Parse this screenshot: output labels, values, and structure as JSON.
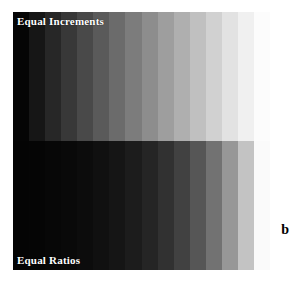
{
  "figure": {
    "letter": "b",
    "panel": {
      "top_label": "Equal Increments",
      "bottom_label": "Equal Ratios",
      "label_color": "#ffffff",
      "background_color": "#ffffff"
    }
  },
  "chart_data": {
    "type": "heatmap",
    "title": "",
    "subtitle": "",
    "xlabel": "",
    "ylabel": "",
    "grid": false,
    "legend_position": "none",
    "colormap": "grayscale",
    "orientation": "horizontal-steps",
    "annotations": [
      {
        "text": "Equal Increments",
        "position": "top-left",
        "color": "#ffffff"
      },
      {
        "text": "Equal Ratios",
        "position": "bottom-left",
        "color": "#ffffff"
      },
      {
        "text": "b",
        "position": "right-margin",
        "color": "#000000"
      }
    ],
    "series": [
      {
        "name": "Equal Increments",
        "description": "Linear (arithmetic) progression of gray levels, left dark to right light",
        "n_steps": 16,
        "x": [
          1,
          2,
          3,
          4,
          5,
          6,
          7,
          8,
          9,
          10,
          11,
          12,
          13,
          14,
          15,
          16
        ],
        "values": [
          5,
          22,
          39,
          56,
          73,
          90,
          107,
          124,
          141,
          158,
          175,
          192,
          209,
          226,
          240,
          252
        ],
        "colors": [
          "#050505",
          "#161616",
          "#272727",
          "#383838",
          "#494949",
          "#5a5a5a",
          "#6b6b6b",
          "#7c7c7c",
          "#8d8d8d",
          "#9e9e9e",
          "#afafaf",
          "#c0c0c0",
          "#d1d1d1",
          "#e2e2e2",
          "#f0f0f0",
          "#fcfcfc"
        ]
      },
      {
        "name": "Equal Ratios",
        "description": "Geometric (constant ratio) progression of gray levels, left dark to right light",
        "n_steps": 16,
        "x": [
          1,
          2,
          3,
          4,
          5,
          6,
          7,
          8,
          9,
          10,
          11,
          12,
          13,
          14,
          15,
          16
        ],
        "values": [
          4,
          5,
          7,
          9,
          12,
          16,
          21,
          28,
          37,
          49,
          65,
          86,
          114,
          151,
          195,
          250
        ],
        "colors": [
          "#040404",
          "#050505",
          "#070707",
          "#090909",
          "#0c0c0c",
          "#101010",
          "#151515",
          "#1c1c1c",
          "#252525",
          "#313131",
          "#414141",
          "#565656",
          "#727272",
          "#979797",
          "#c3c3c3",
          "#fafafa"
        ]
      }
    ],
    "ylim": [
      0,
      255
    ],
    "value_label": "Gray level (0-255)"
  }
}
